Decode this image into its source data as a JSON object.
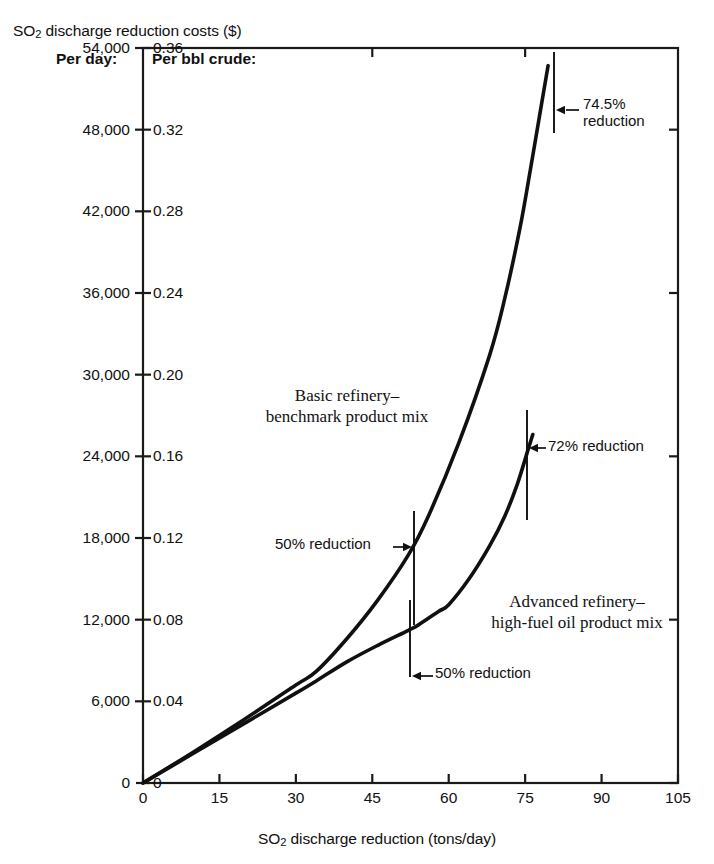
{
  "figure": {
    "y_axis_title_pre": "SO",
    "y_axis_title_sub": "2",
    "y_axis_title_post": " discharge reduction costs ($)",
    "x_axis_title_pre": "SO",
    "x_axis_title_sub": "2",
    "x_axis_title_post": " discharge reduction (tons/day)",
    "per_day_header": "Per day:",
    "per_bbl_header": "Per bbl crude:",
    "line_color": "#101010",
    "axis_color": "#1a1a1a",
    "background": "#ffffff"
  },
  "chart_data": {
    "type": "line",
    "title": "SO2 discharge reduction costs ($)",
    "xlabel": "SO2 discharge reduction (tons/day)",
    "ylabel": "SO2 discharge reduction costs ($)",
    "ylabel_secondary": "Per bbl crude:",
    "ylabel_primary": "Per day:",
    "xlim": [
      0,
      105
    ],
    "ylim": [
      0,
      54000
    ],
    "ylim_secondary": [
      0,
      0.36
    ],
    "grid": false,
    "legend": "inline-labels",
    "xticks": [
      0,
      15,
      30,
      45,
      60,
      75,
      90,
      105
    ],
    "xticklabels": [
      "0",
      "15",
      "30",
      "45",
      "60",
      "75",
      "90",
      "105"
    ],
    "yticks_left": [
      0,
      6000,
      12000,
      18000,
      24000,
      30000,
      36000,
      42000,
      48000,
      54000
    ],
    "yticklabels_left": [
      "0",
      "6,000",
      "12,000",
      "18,000",
      "24,000",
      "30,000",
      "36,000",
      "42,000",
      "48,000",
      "54,000"
    ],
    "yticks_right": [
      0,
      0.04,
      0.08,
      0.12,
      0.16,
      0.2,
      0.24,
      0.28,
      0.32,
      0.36
    ],
    "yticklabels_right": [
      "0",
      "0.04",
      "0.08",
      "0.12",
      "0.16",
      "0.20",
      "0.24",
      "0.28",
      "0.32",
      "0.36"
    ],
    "series": [
      {
        "name": "Basic refinery–benchmark product mix",
        "label_line1": "Basic refinery–",
        "label_line2": "benchmark product mix",
        "x": [
          0,
          10,
          20,
          30,
          34,
          40,
          46,
          52,
          56,
          62,
          68,
          71,
          74,
          76,
          78,
          79.5,
          80.3
        ],
        "y": [
          0,
          2300,
          4700,
          7200,
          8200,
          10600,
          13400,
          16700,
          19600,
          25000,
          31400,
          35600,
          40800,
          45000,
          49400,
          52700,
          54400
        ]
      },
      {
        "name": "Advanced refinery–high-fuel oil product mix",
        "label_line1": "Advanced refinery–",
        "label_line2": "high-fuel oil product mix",
        "x": [
          0,
          10,
          20,
          30,
          34,
          40,
          46,
          52,
          54,
          58,
          60,
          64,
          68,
          71,
          73.5,
          75.5,
          76.5
        ],
        "y": [
          0,
          2200,
          4400,
          6600,
          7500,
          8900,
          10100,
          11200,
          11600,
          12600,
          13100,
          15000,
          17400,
          19600,
          22000,
          24400,
          25600
        ]
      }
    ],
    "annotations": [
      {
        "id": "ann-74-5",
        "label_line1": "74.5%",
        "label_line2": "reduction",
        "series": "Basic refinery–benchmark product mix",
        "x": 80,
        "y": 51500,
        "arrow_direction": "left"
      },
      {
        "id": "ann-72",
        "label_line1": "72% reduction",
        "label_line2": "",
        "series": "Advanced refinery–high-fuel oil product mix",
        "x": 76,
        "y": 25000,
        "arrow_direction": "left"
      },
      {
        "id": "ann-50-basic",
        "label_line1": "50% reduction",
        "label_line2": "",
        "series": "Basic refinery–benchmark product mix",
        "x": 53,
        "y": 17500,
        "arrow_direction": "right"
      },
      {
        "id": "ann-50-advanced",
        "label_line1": "50% reduction",
        "label_line2": "",
        "series": "Advanced refinery–high-fuel oil product mix",
        "x": 53,
        "y": 11500,
        "arrow_direction": "left"
      }
    ]
  }
}
